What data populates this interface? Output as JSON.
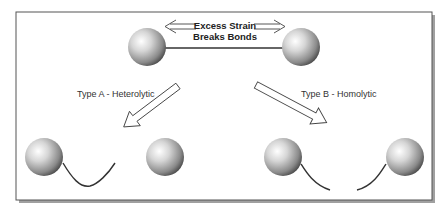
{
  "diagram": {
    "title_line1": "Excess Strain",
    "title_line2": "Breaks Bonds",
    "type_a_label": "Type A - Heterolytic",
    "type_b_label": "Type B - Homolytic",
    "colors": {
      "frame": "#555555",
      "shadow": "#9a9a9a",
      "bond": "#333333",
      "sphere_light": "#ffffff",
      "sphere_mid": "#a8a8a8",
      "sphere_dark": "#3a3a3a",
      "arrow_outline": "#444444"
    }
  }
}
